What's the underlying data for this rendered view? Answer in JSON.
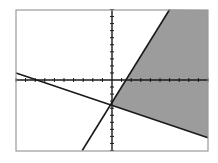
{
  "chart_data": {
    "type": "line",
    "title": "",
    "xlabel": "",
    "ylabel": "",
    "xlim": [
      -10,
      10
    ],
    "ylim": [
      -10,
      10
    ],
    "x_tick_step": 1,
    "y_tick_step": 1,
    "grid": false,
    "legend": null,
    "series": [
      {
        "name": "steep boundary",
        "equation": "y = 2x - 3",
        "slope": 2.26,
        "intercept": -3.3,
        "points": [
          [
            6.0,
            10
          ],
          [
            -3.1,
            -10
          ]
        ]
      },
      {
        "name": "shallow boundary",
        "equation": "y = -0.5x - 3.5",
        "slope": -0.46,
        "intercept": -3.6,
        "points": [
          [
            -10,
            1.0
          ],
          [
            10,
            -8.2
          ]
        ]
      }
    ],
    "shaded_region": {
      "description": "solution region of the inequality system: right of/below the steep line and above the shallow line",
      "vertex": [
        -0.3,
        -3.6
      ]
    }
  },
  "colors": {
    "frame": "#9a9a9a",
    "axes": "#1a1a1a",
    "line": "#1a1a1a",
    "shade": "#9c9c9c",
    "background": "#ffffff"
  },
  "layout": {
    "frame": {
      "left": 16,
      "top": 10,
      "right": 208,
      "bottom": 151
    },
    "origin_px": {
      "x": 112,
      "y": 80
    }
  }
}
